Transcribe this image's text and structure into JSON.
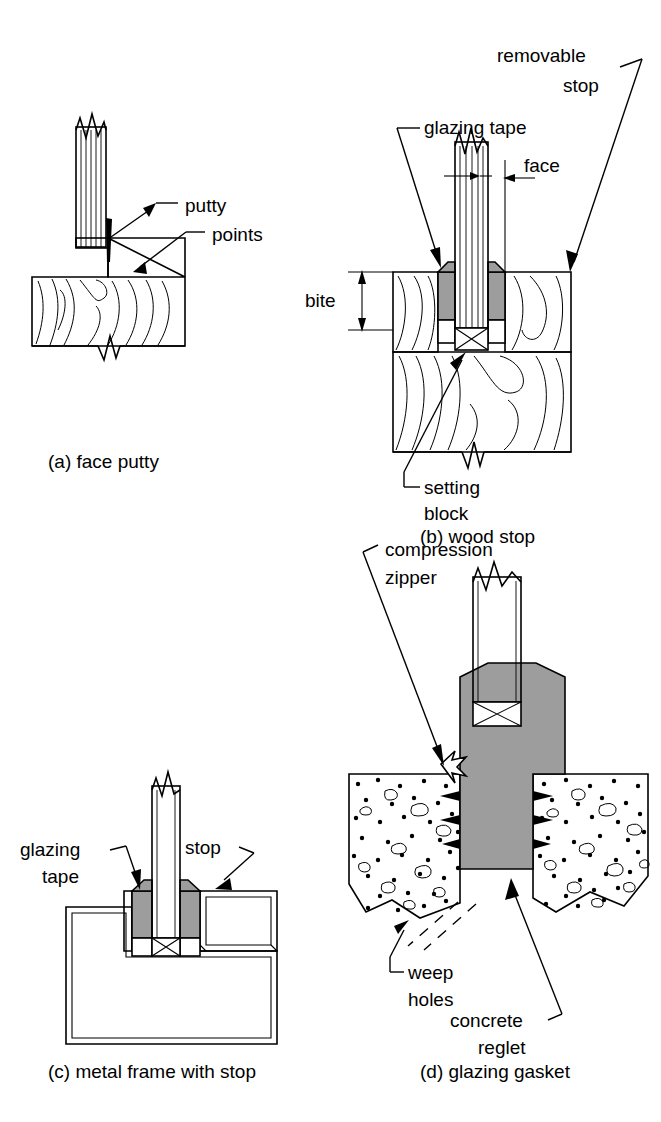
{
  "figure": {
    "panel_count": 4,
    "colors": {
      "line": "#000000",
      "background": "#ffffff",
      "sealant_gray": "#9d9d9d",
      "gasket_gray": "#9d9d9d"
    }
  },
  "panels": [
    {
      "key": "a",
      "caption": "(a) face putty",
      "subject": "face putty glazing in wood sash",
      "labels": [
        {
          "name": "putty",
          "text": "putty"
        },
        {
          "name": "points",
          "text": "points"
        }
      ]
    },
    {
      "key": "b",
      "caption": "(b) wood stop",
      "subject": "wood stop glazing with glazing tape",
      "labels": [
        {
          "name": "removable-stop",
          "text": "removable",
          "text2": "stop"
        },
        {
          "name": "glazing-tape",
          "text": "glazing tape"
        },
        {
          "name": "face",
          "text": "face"
        },
        {
          "name": "bite",
          "text": "bite"
        },
        {
          "name": "setting-block",
          "text": "setting",
          "text2": "block"
        }
      ]
    },
    {
      "key": "c",
      "caption": "(c) metal frame with stop",
      "subject": "metal frame glazing with removable stop",
      "labels": [
        {
          "name": "glazing-tape",
          "text": "glazing",
          "text2": "tape"
        },
        {
          "name": "stop",
          "text": "stop"
        }
      ]
    },
    {
      "key": "d",
      "caption": "(d) glazing gasket",
      "subject": "structural glazing gasket in concrete reglet",
      "labels": [
        {
          "name": "compression-zipper",
          "text": "compression",
          "text2": "zipper"
        },
        {
          "name": "weep-holes",
          "text": "weep",
          "text2": "holes"
        },
        {
          "name": "concrete-reglet",
          "text": "concrete",
          "text2": "reglet"
        }
      ]
    }
  ],
  "captions": {
    "a": "(a) face putty",
    "b": "(b) wood stop",
    "c": "(c) metal frame with stop",
    "d": "(d) glazing gasket"
  },
  "callouts": {
    "putty": "putty",
    "points": "points",
    "removable": "removable",
    "stop_word": "stop",
    "glazing_tape": "glazing tape",
    "face": "face",
    "bite": "bite",
    "setting": "setting",
    "block": "block",
    "glazing": "glazing",
    "tape": "tape",
    "stop": "stop",
    "compression": "compression",
    "zipper": "zipper",
    "weep": "weep",
    "holes": "holes",
    "concrete": "concrete",
    "reglet": "reglet"
  }
}
